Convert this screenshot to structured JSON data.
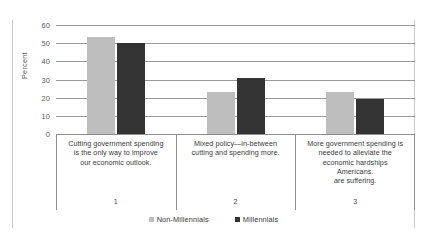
{
  "chart_data": {
    "type": "bar",
    "title": "",
    "xlabel": "",
    "ylabel": "Percent",
    "ylim": [
      0,
      60
    ],
    "yticks": [
      0,
      10,
      20,
      30,
      40,
      50,
      60
    ],
    "grid": true,
    "legend_position": "bottom",
    "categories": [
      "Cutting government spending is the only way to improve our economic outlook.",
      "Mixed policy—in-between cutting and spending more.",
      "More government spending is needed to alleviate the economic hardships Americans. are suffering."
    ],
    "category_numbers": [
      "1",
      "2",
      "3"
    ],
    "series": [
      {
        "name": "Non-Millennials",
        "color": "#bebebe",
        "values": [
          53.5,
          23,
          23
        ]
      },
      {
        "name": "Millennials",
        "color": "#333333",
        "values": [
          50,
          31,
          19
        ]
      }
    ]
  },
  "axis": {
    "y_label": "Percent",
    "y_ticks": [
      "60",
      "50",
      "40",
      "30",
      "20",
      "10",
      "0"
    ]
  },
  "categories": [
    {
      "lines": [
        "Cutting government spending",
        "is the only way to improve",
        "our economic outlook."
      ],
      "number": "1"
    },
    {
      "lines": [
        "Mixed policy—in-between",
        "cutting and spending more."
      ],
      "number": "2"
    },
    {
      "lines": [
        "More government spending is",
        "needed to alleviate the",
        "economic hardships",
        "Americans.",
        "are suffering."
      ],
      "number": "3"
    }
  ],
  "legend": {
    "items": [
      {
        "label": "Non-Millennials",
        "color": "#bebebe"
      },
      {
        "label": "Millennials",
        "color": "#333333"
      }
    ]
  }
}
